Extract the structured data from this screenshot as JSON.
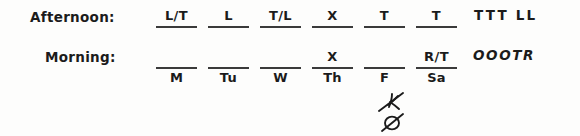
{
  "rows": {
    "afternoon_label": "Afternoon:",
    "morning_label": "Morning:"
  },
  "days": [
    "M",
    "Tu",
    "W",
    "Th",
    "F",
    "Sa"
  ],
  "afternoon_entries": [
    "L/T",
    "L",
    "T/L",
    "X",
    "T",
    "T"
  ],
  "morning_entries": [
    "",
    "",
    "",
    "X",
    "",
    "R/T"
  ],
  "summary": {
    "afternoon": "TTT LL",
    "morning": "OOOTR"
  },
  "annotations": {
    "strike_marks": [
      "crossed-out-mark-upper",
      "crossed-out-mark-lower"
    ]
  },
  "colors": {
    "ink": "#1b1b1b",
    "rule": "#3a3a3a",
    "paper": "#fdfdfc"
  }
}
